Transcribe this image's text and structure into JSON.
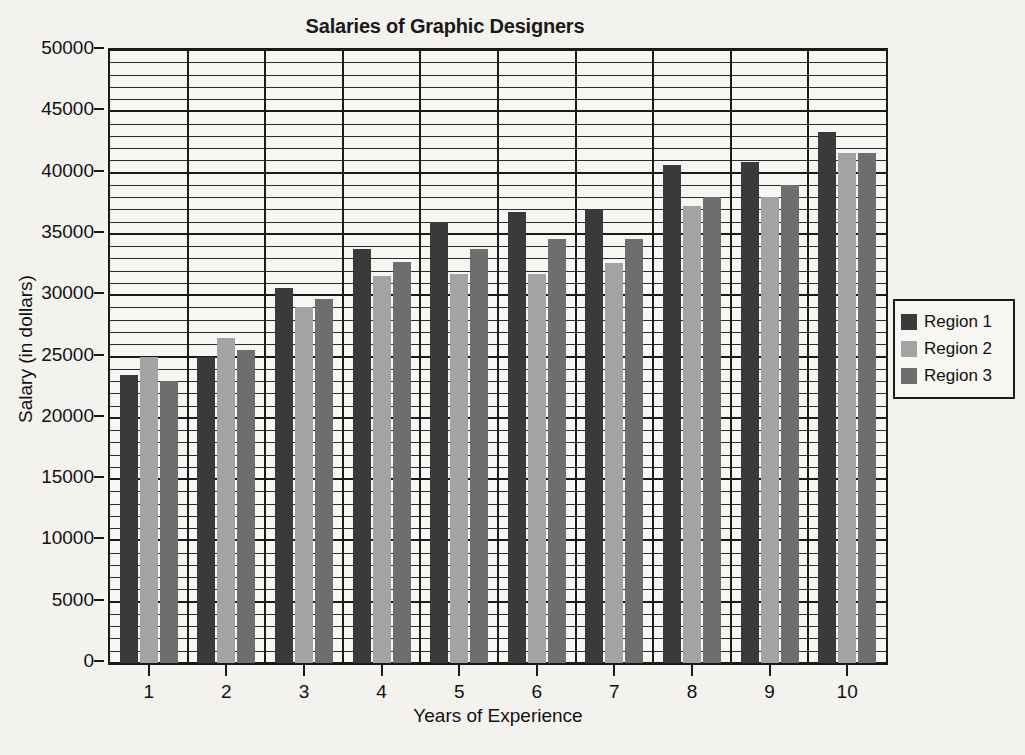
{
  "chart_data": {
    "type": "bar",
    "title": "Salaries of Graphic Designers",
    "xlabel": "Years of Experience",
    "ylabel": "Salary (in dollars)",
    "categories": [
      "1",
      "2",
      "3",
      "4",
      "5",
      "6",
      "7",
      "8",
      "9",
      "10"
    ],
    "ylim": [
      0,
      50000
    ],
    "y_ticks": [
      0,
      5000,
      10000,
      15000,
      20000,
      25000,
      30000,
      35000,
      40000,
      45000,
      50000
    ],
    "y_tick_labels": [
      "0",
      "5000",
      "10000",
      "15000",
      "20000",
      "25000",
      "30000",
      "35000",
      "40000",
      "45000",
      "50000"
    ],
    "y_minor_step": 1000,
    "grid": true,
    "legend_position": "right",
    "series": [
      {
        "name": "Region 1",
        "color": "#3a3a3a",
        "values": [
          23500,
          25000,
          30600,
          33800,
          36000,
          36800,
          37000,
          40600,
          40900,
          43300
        ]
      },
      {
        "name": "Region 2",
        "color": "#a3a3a3",
        "values": [
          25000,
          26500,
          29000,
          31600,
          31700,
          31700,
          32600,
          37300,
          38000,
          41600
        ]
      },
      {
        "name": "Region 3",
        "color": "#6e6e6e",
        "values": [
          23000,
          25500,
          29700,
          32700,
          33800,
          34600,
          34600,
          38000,
          39000,
          41600
        ]
      }
    ]
  }
}
